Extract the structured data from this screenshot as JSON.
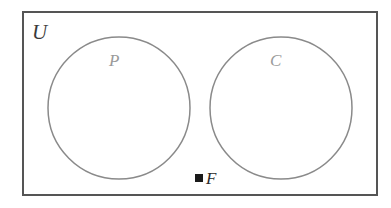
{
  "diagram": {
    "type": "venn-diagram",
    "background_color": "#ffffff",
    "universe": {
      "label": "U",
      "shape": "rectangle",
      "border_color": "#555555",
      "border_width": 2,
      "fill": "#ffffff",
      "x": 22,
      "y": 11,
      "width": 356,
      "height": 185
    },
    "sets": [
      {
        "name": "set-p",
        "label": "P",
        "shape": "circle",
        "stroke_color": "#8a8a8a",
        "stroke_width": 1.5,
        "fill": "none",
        "cx": 119,
        "cy": 108,
        "r": 71,
        "label_color": "#9a9a9a"
      },
      {
        "name": "set-c",
        "label": "C",
        "shape": "circle",
        "stroke_color": "#8a8a8a",
        "stroke_width": 1.5,
        "fill": "none",
        "cx": 281,
        "cy": 108,
        "r": 71,
        "label_color": "#9a9a9a"
      }
    ],
    "elements": [
      {
        "name": "element-f",
        "label": "F",
        "marker": "filled-square",
        "marker_color": "#1a1a1a",
        "marker_size": 8,
        "x": 195,
        "y": 174,
        "location": "inside U, outside P and C"
      }
    ]
  }
}
